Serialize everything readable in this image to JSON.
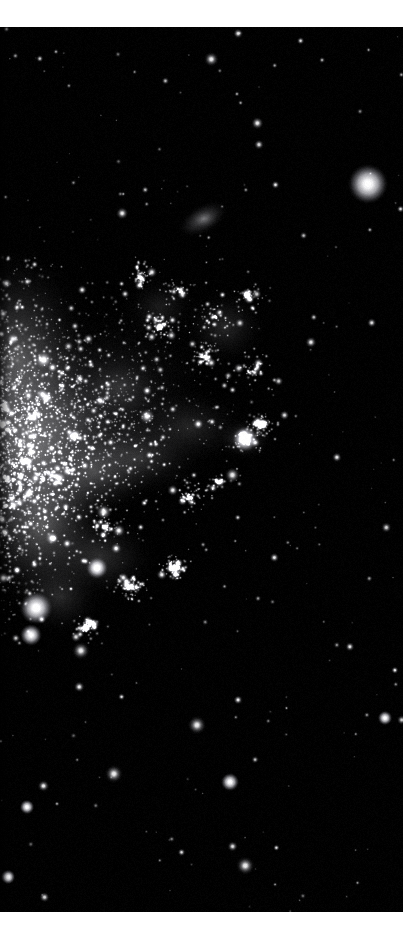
{
  "page": {
    "background_color": "#ffffff",
    "width": 419,
    "height": 934,
    "caption": ""
  },
  "plate": {
    "name": "astronomical-image-plate",
    "background_color": "#000000",
    "x": 0,
    "y": 27,
    "width": 403,
    "height": 885,
    "subject": "dwarf-irregular-galaxy-resolved-stars",
    "colormap": "grayscale"
  },
  "chart_data": {
    "type": "scatter",
    "title": "",
    "subtitle": "",
    "xlabel": "",
    "ylabel": "",
    "xlim": [
      0,
      403
    ],
    "ylim": [
      0,
      885
    ],
    "grid": false,
    "legend": "none",
    "background": "#000000",
    "point_color": "#ffffff",
    "galaxy_body": {
      "name": "dwarf-irregular-galaxy",
      "centroid": [
        70,
        400
      ],
      "position_angle_deg": -35,
      "major_axis_px": 330,
      "minor_axis_px": 210,
      "peak_surface_brightness": 0.72
    },
    "diffuse_clumps": [
      {
        "x": 18,
        "y": 330,
        "rx": 52,
        "ry": 78,
        "intensity": 0.62
      },
      {
        "x": 30,
        "y": 420,
        "rx": 58,
        "ry": 86,
        "intensity": 0.7
      },
      {
        "x": 42,
        "y": 500,
        "rx": 54,
        "ry": 70,
        "intensity": 0.58
      },
      {
        "x": 95,
        "y": 445,
        "rx": 62,
        "ry": 48,
        "intensity": 0.42
      },
      {
        "x": 140,
        "y": 430,
        "rx": 70,
        "ry": 42,
        "intensity": 0.34
      },
      {
        "x": 190,
        "y": 400,
        "rx": 62,
        "ry": 40,
        "intensity": 0.28
      },
      {
        "x": 225,
        "y": 300,
        "rx": 44,
        "ry": 40,
        "intensity": 0.3
      },
      {
        "x": 245,
        "y": 412,
        "rx": 28,
        "ry": 22,
        "intensity": 0.46
      },
      {
        "x": 100,
        "y": 530,
        "rx": 60,
        "ry": 44,
        "intensity": 0.34
      },
      {
        "x": 60,
        "y": 570,
        "rx": 46,
        "ry": 40,
        "intensity": 0.3
      },
      {
        "x": 160,
        "y": 280,
        "rx": 40,
        "ry": 34,
        "intensity": 0.22
      },
      {
        "x": 120,
        "y": 360,
        "rx": 44,
        "ry": 34,
        "intensity": 0.26
      },
      {
        "x": 205,
        "y": 192,
        "rx": 14,
        "ry": 10,
        "intensity": 0.3
      }
    ],
    "bright_stars": [
      {
        "name": "foreground-star-upper-right",
        "x": 368,
        "y": 157,
        "radius": 11,
        "brightness": 1.0
      },
      {
        "name": "foreground-star-lower-left",
        "x": 36,
        "y": 581,
        "radius": 9,
        "brightness": 1.0
      },
      {
        "name": "foreground-star-lower-left-b",
        "x": 31,
        "y": 608,
        "radius": 6,
        "brightness": 0.85
      },
      {
        "name": "field-star-center-low",
        "x": 230,
        "y": 755,
        "radius": 5,
        "brightness": 0.92
      },
      {
        "name": "field-star-right-upper",
        "x": 385,
        "y": 691,
        "radius": 4,
        "brightness": 0.9
      },
      {
        "name": "field-star-left-mid-low",
        "x": 27,
        "y": 780,
        "radius": 4,
        "brightness": 0.82
      },
      {
        "name": "field-star-left-low",
        "x": 8,
        "y": 850,
        "radius": 4,
        "brightness": 0.88
      },
      {
        "name": "cluster-knot-right",
        "x": 245,
        "y": 412,
        "radius": 7,
        "brightness": 0.8
      },
      {
        "name": "cluster-knot-center",
        "x": 97,
        "y": 541,
        "radius": 6,
        "brightness": 0.88
      },
      {
        "name": "background-galaxy",
        "x": 203,
        "y": 192,
        "radius": 8,
        "brightness": 0.42
      }
    ],
    "field_star_count": 260,
    "galaxy_star_count": 1850
  },
  "render": {
    "seed": 20240517,
    "noise_level": 0.035
  }
}
